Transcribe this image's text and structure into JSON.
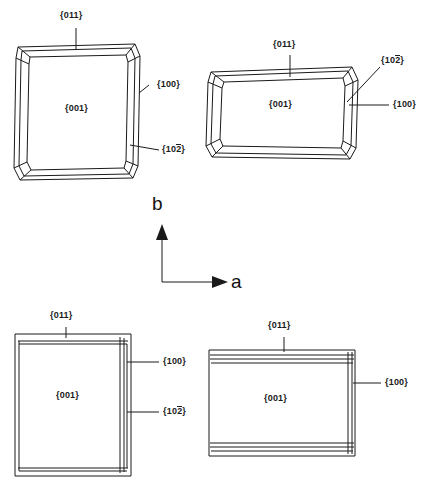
{
  "figure": {
    "background_color": "#ffffff",
    "line_color": "#1a1a1a",
    "text_color": "#1a1a1a"
  },
  "axes": {
    "vertical": {
      "label": "b",
      "direction": "up"
    },
    "horizontal": {
      "label": "a",
      "direction": "right"
    }
  },
  "crystals": [
    {
      "id": "crystal-top-left",
      "position": "top-left",
      "shape": "tall-beveled-prism",
      "face_labels": {
        "top": "{011}",
        "center": "{001}",
        "right_upper": "{100}",
        "right_lower_prefix": "{10",
        "right_lower_overbar": "2",
        "right_lower_suffix": "}"
      }
    },
    {
      "id": "crystal-top-right",
      "position": "top-right",
      "shape": "wide-beveled-prism",
      "face_labels": {
        "top": "{011}",
        "center": "{001}",
        "right_upper_prefix": "{10",
        "right_upper_overbar": "2",
        "right_upper_suffix": "}",
        "right_lower": "{100}"
      }
    },
    {
      "id": "crystal-bottom-left",
      "position": "bottom-left",
      "shape": "tall-banded-prism",
      "face_labels": {
        "top": "{011}",
        "center": "{001}",
        "right_upper": "{100}",
        "right_lower_prefix": "{10",
        "right_lower_overbar": "2",
        "right_lower_suffix": "}"
      }
    },
    {
      "id": "crystal-bottom-right",
      "position": "bottom-right",
      "shape": "wide-banded-prism",
      "face_labels": {
        "top": "{011}",
        "center": "{001}",
        "right": "{100}"
      }
    }
  ]
}
